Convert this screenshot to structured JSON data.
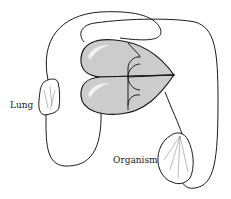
{
  "diagram": {
    "type": "double-circulation schematic",
    "labels": {
      "lung": "Lung",
      "organism": "Organism"
    },
    "colors": {
      "line": "#1a1a1a",
      "heart_fill": "#cccccc",
      "highlight": "#f2f2f2",
      "background": "#ffffff"
    },
    "nodes": [
      {
        "id": "heart",
        "description": "four-chambered heart (two lobes with valves)"
      },
      {
        "id": "lung",
        "label": "Lung"
      },
      {
        "id": "organism",
        "label": "Organism"
      }
    ]
  }
}
